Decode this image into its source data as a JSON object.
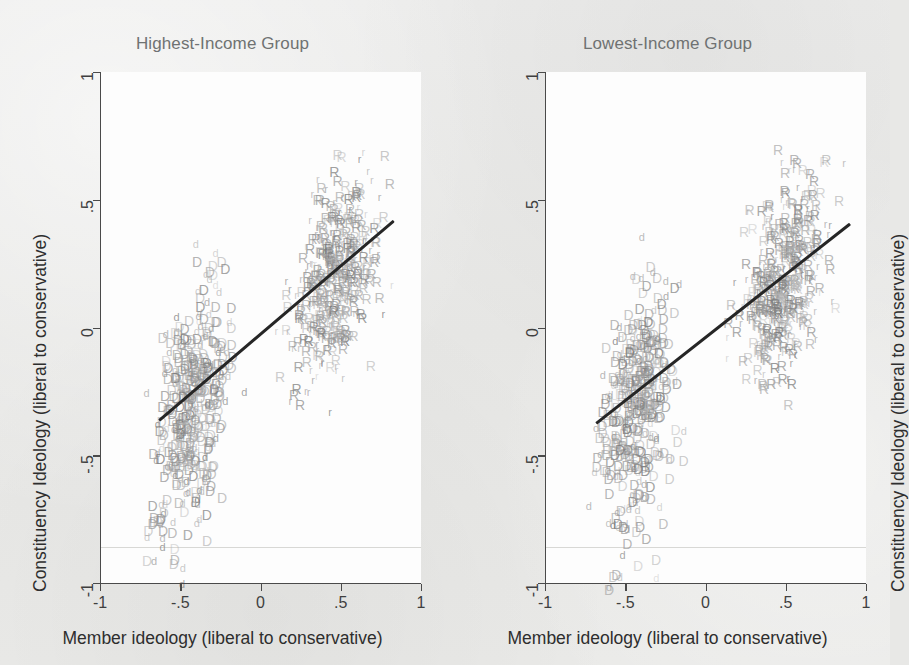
{
  "figure": {
    "background_color": "#e8e8e6",
    "plot_background_color": "#fdfdfd",
    "axis_color": "#4a4a4a",
    "fit_line_color": "#262626",
    "title_color": "#6f7272",
    "democrat_marker_color": "#8a8a8a",
    "republican_marker_color": "#8a8a8a"
  },
  "chart_data": [
    {
      "type": "scatter",
      "title": "Highest-Income Group",
      "xlabel": "Member ideology (liberal to conservative)",
      "ylabel": "Constituency Ideology (liberal to conservative)",
      "xlim": [
        -1,
        1
      ],
      "ylim": [
        -1,
        1
      ],
      "xticks": [
        -1,
        -0.5,
        0,
        0.5,
        1
      ],
      "xticklabels": [
        "-1",
        "-.5",
        "0",
        ".5",
        "1"
      ],
      "yticks": [
        -1,
        -0.5,
        0,
        0.5,
        1
      ],
      "yticklabels": [
        "-1",
        "-.5",
        "0",
        ".5",
        "1"
      ],
      "grid": false,
      "legend": "none",
      "marker_style": "text-letters",
      "series": [
        {
          "name": "Democrats (D = House, d = Senate)",
          "glyphs": [
            "D",
            "d"
          ],
          "color": "#8a8a8a",
          "x_range": [
            -0.72,
            0.12
          ],
          "y_range": [
            -1.02,
            0.42
          ],
          "n_points": 430
        },
        {
          "name": "Republicans (R = House, r = Senate)",
          "glyphs": [
            "R",
            "r"
          ],
          "color": "#8a8a8a",
          "x_range": [
            0.08,
            0.88
          ],
          "y_range": [
            -0.45,
            0.72
          ],
          "n_points": 430
        }
      ],
      "fit_line": {
        "label": "linear fit",
        "x0": -0.63,
        "y0": -0.36,
        "x1": 0.83,
        "y1": 0.42
      }
    },
    {
      "type": "scatter",
      "title": "Lowest-Income Group",
      "xlabel": "Member ideology (liberal to conservative)",
      "ylabel": "Constituency Ideology (liberal to conservative)",
      "xlim": [
        -1,
        1
      ],
      "ylim": [
        -1,
        1
      ],
      "xticks": [
        -1,
        -0.5,
        0,
        0.5,
        1
      ],
      "xticklabels": [
        "-1",
        "-.5",
        "0",
        ".5",
        "1"
      ],
      "yticks": [
        -1,
        -0.5,
        0,
        0.5,
        1
      ],
      "yticklabels": [
        "-1",
        "-.5",
        "0",
        ".5",
        "1"
      ],
      "grid": false,
      "legend": "none",
      "marker_style": "text-letters",
      "series": [
        {
          "name": "Democrats (D = House, d = Senate)",
          "glyphs": [
            "D",
            "d"
          ],
          "color": "#8a8a8a",
          "x_range": [
            -0.74,
            0.14
          ],
          "y_range": [
            -1.05,
            0.4
          ],
          "n_points": 430
        },
        {
          "name": "Republicans (R = House, r = Senate)",
          "glyphs": [
            "R",
            "r"
          ],
          "color": "#8a8a8a",
          "x_range": [
            0.1,
            0.92
          ],
          "y_range": [
            -0.42,
            0.7
          ],
          "n_points": 430
        }
      ],
      "fit_line": {
        "label": "linear fit",
        "x0": -0.68,
        "y0": -0.37,
        "x1": 0.9,
        "y1": 0.41
      }
    }
  ]
}
